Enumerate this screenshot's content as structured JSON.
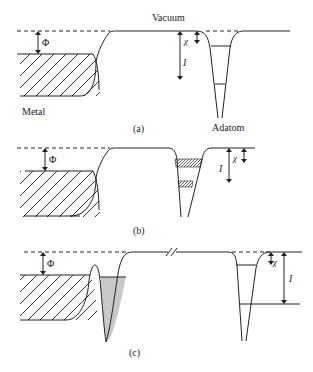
{
  "figure": {
    "panels": [
      {
        "id": "a",
        "caption": "(a)",
        "labels": {
          "vacuum": "Vacuum",
          "metal": "Metal",
          "adatom": "Adatom",
          "work_function": "Φ",
          "electron_affinity": "χ",
          "ionization": "I"
        }
      },
      {
        "id": "b",
        "caption": "(b)",
        "labels": {
          "work_function": "Φ",
          "electron_affinity": "χ",
          "ionization": "I"
        }
      },
      {
        "id": "c",
        "caption": "(c)",
        "labels": {
          "work_function": "Φ",
          "electron_affinity": "χ",
          "ionization": "I"
        }
      }
    ]
  }
}
